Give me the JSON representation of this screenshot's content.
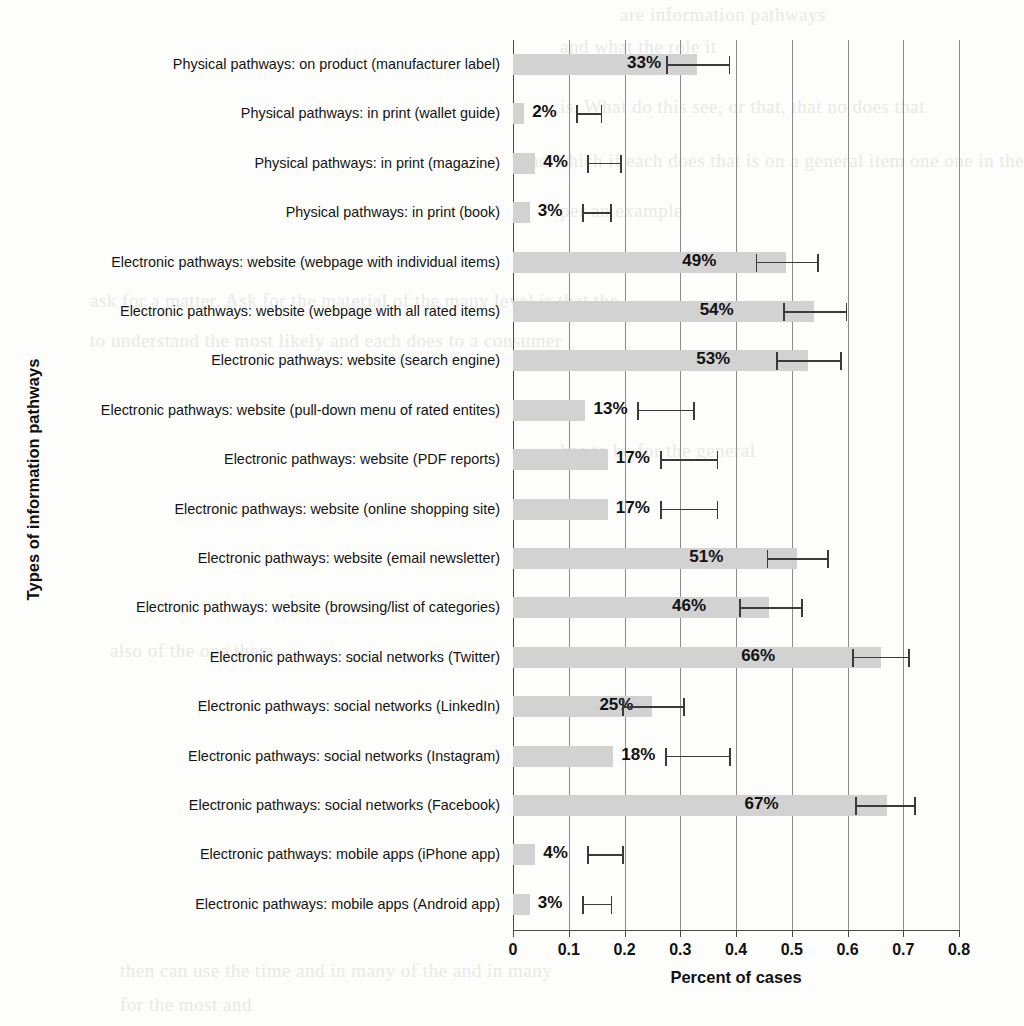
{
  "chart_data": {
    "type": "bar",
    "orientation": "horizontal",
    "title": "",
    "xlabel": "Percent of cases",
    "ylabel": "Types of information pathways",
    "xlim": [
      0,
      0.8
    ],
    "xticks": [
      "0",
      "0.1",
      "0.2",
      "0.3",
      "0.4",
      "0.5",
      "0.6",
      "0.7",
      "0.8"
    ],
    "xtick_values": [
      0,
      0.1,
      0.2,
      0.3,
      0.4,
      0.5,
      0.6,
      0.7,
      0.8
    ],
    "grid": "vertical",
    "legend": "none",
    "bar_color": "#d2d2d2",
    "error_color": "#3a3a3a",
    "categories": [
      "Physical pathways: on product (manufacturer label)",
      "Physical pathways: in print (wallet guide)",
      "Physical pathways: in print (magazine)",
      "Physical pathways: in print (book)",
      "Electronic pathways: website (webpage with individual items)",
      "Electronic pathways: website (webpage with all rated items)",
      "Electronic pathways: website (search engine)",
      "Electronic pathways: website (pull-down menu of rated entites)",
      "Electronic pathways: website (PDF reports)",
      "Electronic pathways: website (online shopping site)",
      "Electronic pathways: website (email newsletter)",
      "Electronic pathways: website (browsing/list of categories)",
      "Electronic pathways: social networks (Twitter)",
      "Electronic pathways: social networks (LinkedIn)",
      "Electronic pathways: social networks (Instagram)",
      "Electronic pathways: social networks (Facebook)",
      "Electronic pathways: mobile apps (iPhone app)",
      "Electronic pathways: mobile apps (Android app)"
    ],
    "values": [
      0.33,
      0.02,
      0.04,
      0.03,
      0.49,
      0.54,
      0.53,
      0.13,
      0.17,
      0.17,
      0.51,
      0.46,
      0.66,
      0.25,
      0.18,
      0.67,
      0.04,
      0.03
    ],
    "data_labels": [
      "33%",
      "2%",
      "4%",
      "3%",
      "49%",
      "54%",
      "53%",
      "13%",
      "17%",
      "17%",
      "51%",
      "46%",
      "66%",
      "25%",
      "18%",
      "67%",
      "4%",
      "3%"
    ],
    "error_low": [
      0.275,
      0.003,
      0.013,
      0.008,
      0.435,
      0.485,
      0.472,
      0.082,
      0.117,
      0.113,
      0.455,
      0.405,
      0.608,
      0.195,
      0.125,
      0.613,
      0.012,
      0.008
    ],
    "error_high": [
      0.39,
      0.05,
      0.075,
      0.062,
      0.548,
      0.6,
      0.59,
      0.185,
      0.222,
      0.218,
      0.567,
      0.52,
      0.712,
      0.308,
      0.242,
      0.722,
      0.078,
      0.063
    ]
  },
  "bleed_text": [
    "are information pathways",
    "and what the role it",
    "is. What do this see, or that, that no does that",
    "and which if each does that is on a general item one one in the",
    "per an example",
    "ask for a matter. Ask for the material of the many level is that the",
    "to understand the most likely and each does to a consumer",
    "has to be for the general",
    "also of the one them",
    "then can use the time and in many of the and in many",
    "for the most and"
  ]
}
